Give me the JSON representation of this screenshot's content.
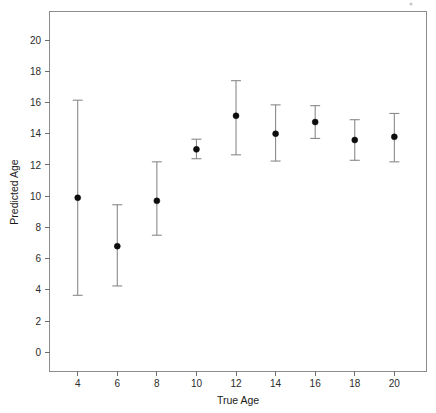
{
  "chart_data": {
    "type": "scatter",
    "title": "",
    "xlabel": "True Age",
    "ylabel": "Predicted Age",
    "grid": false,
    "legend": null,
    "xlim": [
      2.6,
      21.6
    ],
    "ylim": [
      -1.2,
      21.8
    ],
    "xticks": [
      4,
      6,
      8,
      10,
      12,
      14,
      16,
      18,
      20
    ],
    "yticks": [
      0,
      2,
      4,
      6,
      8,
      10,
      12,
      14,
      16,
      18,
      20
    ],
    "xtick_labels": [
      "4",
      "6",
      "8",
      "10",
      "12",
      "14",
      "16",
      "18",
      "20"
    ],
    "ytick_labels": [
      "0",
      "2",
      "4",
      "6",
      "8",
      "10",
      "12",
      "14",
      "16",
      "18",
      "20"
    ],
    "marker": "filled-circle",
    "error_bars": "vertical-with-caps",
    "x": [
      4,
      6,
      8,
      10,
      12,
      14,
      16,
      18,
      20
    ],
    "values": [
      9.9,
      6.8,
      9.7,
      13.0,
      15.15,
      14.0,
      14.75,
      13.6,
      13.8
    ],
    "y_lower": [
      3.65,
      4.25,
      7.5,
      12.4,
      12.65,
      12.25,
      13.7,
      12.3,
      12.2
    ],
    "y_upper": [
      16.15,
      9.45,
      12.2,
      13.65,
      17.4,
      15.85,
      15.8,
      14.9,
      15.3
    ],
    "points": [
      {
        "x": 4,
        "y": 9.9,
        "low": 3.65,
        "high": 16.15
      },
      {
        "x": 6,
        "y": 6.8,
        "low": 4.25,
        "high": 9.45
      },
      {
        "x": 8,
        "y": 9.7,
        "low": 7.5,
        "high": 12.2
      },
      {
        "x": 10,
        "y": 13.0,
        "low": 12.4,
        "high": 13.65
      },
      {
        "x": 12,
        "y": 15.15,
        "low": 12.65,
        "high": 17.4
      },
      {
        "x": 14,
        "y": 14.0,
        "low": 12.25,
        "high": 15.85
      },
      {
        "x": 16,
        "y": 14.75,
        "low": 13.7,
        "high": 15.8
      },
      {
        "x": 18,
        "y": 13.6,
        "low": 12.3,
        "high": 14.9
      },
      {
        "x": 20,
        "y": 13.8,
        "low": 12.2,
        "high": 15.3
      }
    ],
    "colors": {
      "point": "#0d0d0d",
      "error_bar": "#8a8a8a",
      "panel_border": "#8c8c8c",
      "text": "#1a1a1a",
      "background": "#ffffff"
    }
  }
}
